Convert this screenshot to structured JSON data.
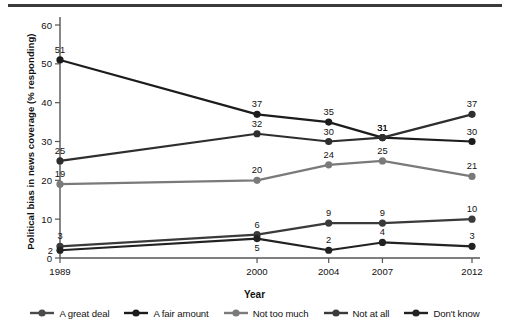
{
  "figure": {
    "top_rule": "horizontal-rule"
  },
  "chart_data": {
    "type": "line",
    "title": "",
    "xlabel": "Year",
    "ylabel": "Political bias in news coverage (% responding)",
    "categories": [
      "1989",
      "2000",
      "2004",
      "2007",
      "2012"
    ],
    "x": [
      1989,
      2000,
      2004,
      2007,
      2012
    ],
    "xlim": [
      1989,
      2012
    ],
    "ylim": [
      0,
      60
    ],
    "yticks": [
      0,
      10,
      20,
      30,
      40,
      50,
      60
    ],
    "ytick_labels": [
      "0",
      "10",
      "20",
      "30",
      "40",
      "50",
      "60"
    ],
    "xtick_labels": [
      "1989",
      "2000",
      "2004",
      "2007",
      "2012"
    ],
    "grid": false,
    "legend_position": "bottom",
    "data_labels": true,
    "series": [
      {
        "name": "A great deal",
        "color": "#1c1c1c",
        "values": [
          51,
          37,
          35,
          31,
          30
        ],
        "label_positions": [
          "above",
          "above",
          "above",
          "above",
          "above"
        ]
      },
      {
        "name": "A fair amount",
        "color": "#2e2e2e",
        "values": [
          25,
          32,
          30,
          31,
          37
        ],
        "label_positions": [
          "above",
          "above",
          "above",
          "above",
          "above"
        ]
      },
      {
        "name": "Not too much",
        "color": "#7a7a7a",
        "values": [
          19,
          20,
          24,
          25,
          21
        ],
        "label_positions": [
          "above",
          "above",
          "above",
          "above",
          "above"
        ]
      },
      {
        "name": "Not at all",
        "color": "#3a3a3a",
        "values": [
          3,
          6,
          9,
          9,
          10
        ],
        "label_positions": [
          "above",
          "above",
          "above",
          "above",
          "above"
        ]
      },
      {
        "name": "Don't know",
        "color": "#222222",
        "values": [
          2,
          5,
          2,
          4,
          3
        ],
        "label_positions": [
          "left",
          "below",
          "above",
          "above",
          "above"
        ]
      }
    ]
  },
  "legend": {
    "items": [
      {
        "label": "A great deal",
        "color": "#4a4a4a"
      },
      {
        "label": "A fair amount",
        "color": "#1c1c1c"
      },
      {
        "label": "Not too much",
        "color": "#7a7a7a"
      },
      {
        "label": "Not at all",
        "color": "#3a3a3a"
      },
      {
        "label": "Don't know",
        "color": "#222222"
      }
    ]
  }
}
